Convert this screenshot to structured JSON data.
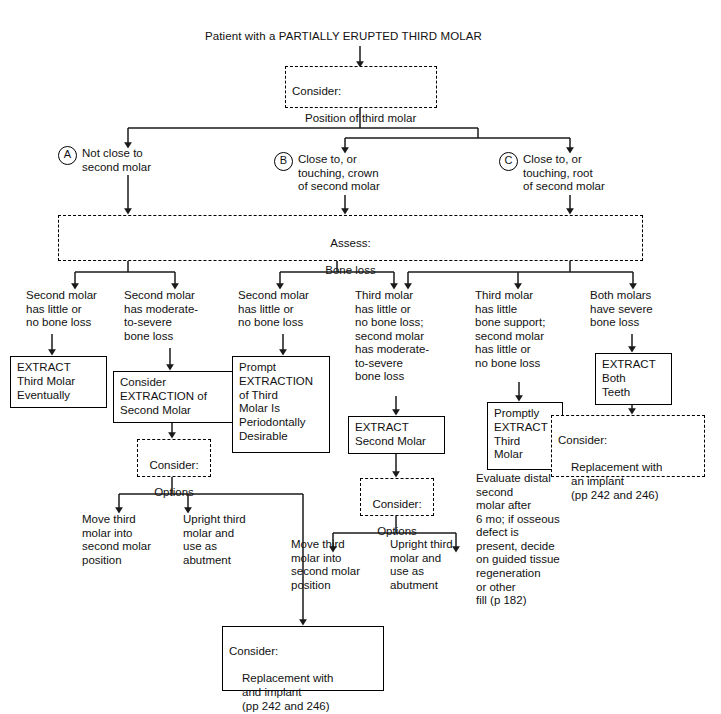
{
  "diagram": {
    "title": "Patient with a PARTIALLY ERUPTED THIRD MOLAR",
    "root": {
      "line1": "Consider:",
      "line2": "Position of third molar"
    },
    "branches": [
      {
        "marker": "A",
        "text": "Not close to\nsecond molar"
      },
      {
        "marker": "B",
        "text": "Close to, or\ntouching, crown\nof second molar"
      },
      {
        "marker": "C",
        "text": "Close to, or\ntouching, root\nof second molar"
      }
    ],
    "assess": {
      "line1": "Assess:",
      "line2": "Bone loss"
    },
    "conditions": [
      {
        "id": "cond-1",
        "text": "Second molar\nhas little or\nno bone loss"
      },
      {
        "id": "cond-2",
        "text": "Second molar\nhas moderate-\nto-severe\nbone loss"
      },
      {
        "id": "cond-3",
        "text": "Second molar\nhas little or\nno bone loss"
      },
      {
        "id": "cond-4",
        "text": "Third molar\nhas little or\nno bone loss;\nsecond molar\nhas moderate-\nto-severe\nbone loss"
      },
      {
        "id": "cond-5",
        "text": "Third molar\nhas little\nbone support;\nsecond molar\nhas little or\nno bone loss"
      },
      {
        "id": "cond-6",
        "text": "Both molars\nhave severe\nbone loss"
      }
    ],
    "actions": [
      {
        "id": "extract-third-molar-eventually",
        "text": "EXTRACT\nThird Molar\nEventually"
      },
      {
        "id": "consider-extraction-second-molar",
        "text": "Consider\nEXTRACTION of\nSecond Molar"
      },
      {
        "id": "prompt-extraction-third-molar",
        "text": "Prompt\nEXTRACTION\nof Third\nMolar Is\nPeriodontally\nDesirable"
      },
      {
        "id": "extract-second-molar",
        "text": "EXTRACT\nSecond Molar"
      },
      {
        "id": "promptly-extract-third-molar",
        "text": "Promptly\nEXTRACT\nThird\nMolar"
      },
      {
        "id": "extract-both-teeth",
        "text": "EXTRACT\nBoth\nTeeth"
      }
    ],
    "options_boxes": [
      {
        "id": "consider-options-left",
        "line1": "Consider:",
        "line2": "Options"
      },
      {
        "id": "consider-options-middle",
        "line1": "Consider:",
        "line2": "Options"
      }
    ],
    "option_outcomes": [
      {
        "id": "move-third-molar-left",
        "text": "Move third\nmolar into\nsecond molar\nposition"
      },
      {
        "id": "upright-third-molar-left",
        "text": "Upright third\nmolar and\nuse as\nabutment"
      },
      {
        "id": "move-third-molar-middle",
        "text": "Move third\nmolar into\nsecond molar\nposition"
      },
      {
        "id": "upright-third-molar-middle",
        "text": "Upright third\nmolar and\nuse as\nabutment"
      }
    ],
    "evaluate_note": "Evaluate distal\nsecond\nmolar after\n6 mo; if osseous\ndefect is\npresent, decide\non guided tissue\nregeneration\nor other\nfill (p 182)",
    "replacement_dashed": {
      "line1": "Consider:",
      "line2": "Replacement with",
      "line3": "an implant",
      "line4": "(pp 242 and 246)"
    },
    "replacement_solid": {
      "line1": "Consider:",
      "line2": "Replacement with",
      "line3": "and implant",
      "line4": "(pp 242 and 246)"
    },
    "colors": {
      "line": "#1a1a1a",
      "text": "#111111",
      "background": "#ffffff"
    }
  }
}
